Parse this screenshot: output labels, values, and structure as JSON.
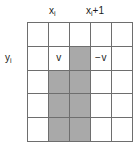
{
  "figure": {
    "name": "grid-diagram",
    "labels": {
      "column_left": {
        "base": "x",
        "subscript": "i",
        "suffix": ""
      },
      "column_right": {
        "base": "x",
        "subscript": "i",
        "suffix": "+1"
      },
      "row_left": {
        "base": "y",
        "subscript": "i",
        "suffix": ""
      }
    },
    "colors": {
      "shaded_cell": "#a9a9a9",
      "empty_cell": "#ffffff",
      "grid_line": "#6e6e6e",
      "text": "#1a1a1a",
      "background": "#ffffff"
    },
    "grid": {
      "rows": 5,
      "cols": 5,
      "cells": [
        [
          {
            "value": "",
            "shaded": false
          },
          {
            "value": "",
            "shaded": false
          },
          {
            "value": "",
            "shaded": false
          },
          {
            "value": "",
            "shaded": false
          },
          {
            "value": "",
            "shaded": false
          }
        ],
        [
          {
            "value": "",
            "shaded": false
          },
          {
            "value": "v",
            "shaded": false
          },
          {
            "value": "",
            "shaded": true
          },
          {
            "value": "−v",
            "shaded": false
          },
          {
            "value": "",
            "shaded": false
          }
        ],
        [
          {
            "value": "",
            "shaded": false
          },
          {
            "value": "",
            "shaded": true
          },
          {
            "value": "",
            "shaded": true
          },
          {
            "value": "",
            "shaded": false
          },
          {
            "value": "",
            "shaded": false
          }
        ],
        [
          {
            "value": "",
            "shaded": false
          },
          {
            "value": "",
            "shaded": true
          },
          {
            "value": "",
            "shaded": true
          },
          {
            "value": "",
            "shaded": false
          },
          {
            "value": "",
            "shaded": false
          }
        ],
        [
          {
            "value": "",
            "shaded": false
          },
          {
            "value": "",
            "shaded": true
          },
          {
            "value": "",
            "shaded": true
          },
          {
            "value": "",
            "shaded": false
          },
          {
            "value": "",
            "shaded": false
          }
        ]
      ]
    }
  }
}
